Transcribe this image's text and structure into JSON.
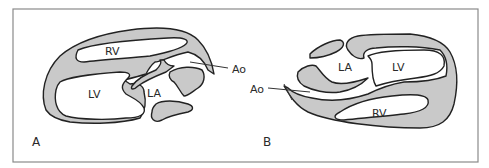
{
  "figure": {
    "type": "echocardiographic schematic",
    "colors": {
      "wall": "#c9c9c9",
      "outline": "#222222",
      "frame": "#8a8a8a",
      "background": "#ffffff"
    },
    "panels": [
      {
        "id": "A",
        "panel_label": "A",
        "structures": {
          "rv": "RV",
          "lv": "LV",
          "la": "LA",
          "ao": "Ao"
        }
      },
      {
        "id": "B",
        "panel_label": "B",
        "structures": {
          "rv": "RV",
          "lv": "LV",
          "la": "LA",
          "ao": "Ao"
        }
      }
    ]
  }
}
